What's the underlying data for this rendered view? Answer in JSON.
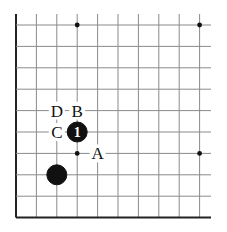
{
  "diagram": {
    "type": "go-board-fragment",
    "board_region": "lower-left corner",
    "grid": {
      "columns": 10,
      "rows": 10,
      "x_origin": 16,
      "y_origin": 25,
      "spacing_x": 20.4,
      "spacing_y": 21.4,
      "line_color": "#8a8a8a",
      "edge_color": "#222222"
    },
    "star_points": [
      {
        "col": 3,
        "row": 0
      },
      {
        "col": 9,
        "row": 0
      },
      {
        "col": 3,
        "row": 6
      },
      {
        "col": 9,
        "row": 6
      }
    ],
    "stones": [
      {
        "col": 2,
        "row": 7,
        "color": "black",
        "label": ""
      },
      {
        "col": 3,
        "row": 5,
        "color": "black",
        "label": "1"
      }
    ],
    "markers": [
      {
        "col": 2,
        "row": 4,
        "label": "D"
      },
      {
        "col": 3,
        "row": 4,
        "label": "B"
      },
      {
        "col": 2,
        "row": 5,
        "label": "C"
      },
      {
        "col": 4,
        "row": 6,
        "label": "A"
      }
    ]
  }
}
